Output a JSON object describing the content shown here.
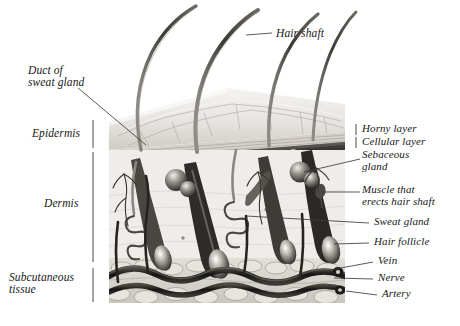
{
  "figure": {
    "style": "grayscale anatomical engraving",
    "colors": {
      "ink": "#181818",
      "leader": "#3c3c3c",
      "horny_layer": "#2a2a2a",
      "dermis_ground": "#eceae6",
      "fat": "#d8d5cf",
      "vessel_dark": "#1e1e1e",
      "background": "#ffffff"
    }
  },
  "labels_left": [
    {
      "id": "duct-of-sweat-gland",
      "text": "Duct of\nsweat gland",
      "x": 28,
      "y": 70
    },
    {
      "id": "epidermis",
      "text": "Epidermis",
      "x": 32,
      "y": 127
    },
    {
      "id": "dermis",
      "text": "Dermis",
      "x": 44,
      "y": 197
    },
    {
      "id": "subcutaneous-tissue",
      "text": "Subcutaneous\ntissue",
      "x": 9,
      "y": 277
    }
  ],
  "labels_right": [
    {
      "id": "hair-shaft",
      "text": "Hair shaft",
      "x": 276,
      "y": 29
    },
    {
      "id": "horny-layer",
      "text": "Horny layer",
      "x": 362,
      "y": 128
    },
    {
      "id": "cellular-layer",
      "text": "Cellular layer",
      "x": 362,
      "y": 140
    },
    {
      "id": "sebaceous-gland",
      "text": "Sebaceous\ngland",
      "x": 362,
      "y": 152
    },
    {
      "id": "muscle-that-erects-hair-shaft",
      "text": "Muscle that\nerects hair shaft",
      "x": 362,
      "y": 187
    },
    {
      "id": "sweat-gland",
      "text": "Sweat gland",
      "x": 372,
      "y": 219
    },
    {
      "id": "hair-follicle",
      "text": "Hair follicle",
      "x": 372,
      "y": 239
    },
    {
      "id": "vein",
      "text": "Vein",
      "x": 376,
      "y": 259
    },
    {
      "id": "nerve",
      "text": "Nerve",
      "x": 376,
      "y": 276
    },
    {
      "id": "artery",
      "text": "Artery",
      "x": 380,
      "y": 292
    }
  ],
  "brackets": {
    "epidermis": {
      "x": 93,
      "y1": 120,
      "y2": 148
    },
    "dermis": {
      "x": 93,
      "y1": 152,
      "y2": 262
    },
    "subcutaneous": {
      "x": 93,
      "y1": 268,
      "y2": 302
    },
    "horny_layer": {
      "x": 356,
      "y1": 124,
      "y2": 135
    },
    "cellular_layer": {
      "x": 356,
      "y1": 137,
      "y2": 148
    }
  }
}
